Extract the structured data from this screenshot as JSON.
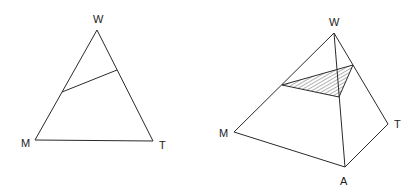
{
  "figures": [
    {
      "id": "ternary-triangle",
      "type": "triangle",
      "vertices": {
        "W": {
          "label": "W",
          "x": 97,
          "y": 30,
          "label_x": 93,
          "label_y": 23
        },
        "M": {
          "label": "M",
          "x": 35,
          "y": 140,
          "label_x": 21,
          "label_y": 147
        },
        "T": {
          "label": "T",
          "x": 153,
          "y": 141,
          "label_x": 159,
          "label_y": 149
        }
      },
      "cross_section_line": {
        "x1": 62,
        "y1": 92,
        "x2": 117,
        "y2": 70
      }
    },
    {
      "id": "tetrahedron",
      "type": "pyramid",
      "vertices": {
        "W": {
          "label": "W",
          "x": 334,
          "y": 33,
          "label_x": 329,
          "label_y": 26
        },
        "M": {
          "label": "M",
          "x": 234,
          "y": 132,
          "label_x": 219,
          "label_y": 137
        },
        "T": {
          "label": "T",
          "x": 388,
          "y": 124,
          "label_x": 394,
          "label_y": 128
        },
        "A": {
          "label": "A",
          "x": 345,
          "y": 167,
          "label_x": 340,
          "label_y": 185
        }
      },
      "shaded_section": {
        "points": [
          [
            282,
            85
          ],
          [
            353,
            65
          ],
          [
            339,
            97
          ]
        ],
        "hidden_edge_point": [
          337,
          71
        ]
      }
    }
  ]
}
